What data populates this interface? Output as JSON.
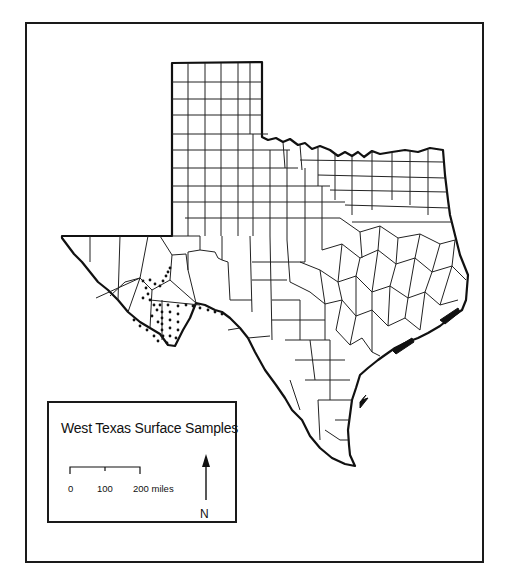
{
  "map": {
    "title": "West Texas Surface Samples",
    "region": "Texas county map",
    "colors": {
      "outline": "#111111",
      "county_lines": "#222222",
      "sample_dots": "#111111",
      "background": "#ffffff"
    }
  },
  "legend": {
    "title": "West Texas Surface Samples",
    "scale_bar": {
      "ticks": [
        "0",
        "100",
        "200 miles"
      ]
    },
    "north_arrow": {
      "label": "N"
    }
  }
}
